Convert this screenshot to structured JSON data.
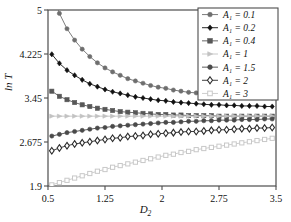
{
  "chart_data": {
    "type": "line",
    "title": "",
    "xlabel": "D2",
    "ylabel": "ln T",
    "xlim": [
      0.5,
      3.5
    ],
    "ylim": [
      1.9,
      5.0
    ],
    "xticks": [
      "0.5",
      "1.25",
      "2",
      "2.75",
      "3.5"
    ],
    "xtick_values": [
      0.5,
      1.25,
      2,
      2.75,
      3.5
    ],
    "yticks": [
      "1.9",
      "2.675",
      "3.45",
      "4.225",
      "5"
    ],
    "ytick_values": [
      1.9,
      2.675,
      3.45,
      4.225,
      5.0
    ],
    "grid": false,
    "legend_position": "top-right",
    "x": [
      0.55,
      0.65,
      0.75,
      0.85,
      0.95,
      1.05,
      1.15,
      1.25,
      1.35,
      1.45,
      1.55,
      1.65,
      1.75,
      1.85,
      1.95,
      2.05,
      2.15,
      2.25,
      2.35,
      2.45,
      2.55,
      2.65,
      2.75,
      2.85,
      2.95,
      3.05,
      3.15,
      3.25,
      3.35,
      3.45
    ],
    "series": [
      {
        "name": "A1 = 0.1",
        "label": "A₁ = 0.1",
        "marker": "filled-circle",
        "color": "#6e6e6e",
        "values": [
          5.38,
          4.94,
          4.67,
          4.47,
          4.31,
          4.18,
          4.07,
          3.98,
          3.91,
          3.85,
          3.79,
          3.75,
          3.71,
          3.67,
          3.64,
          3.62,
          3.59,
          3.57,
          3.55,
          3.54,
          3.52,
          3.51,
          3.5,
          3.49,
          3.48,
          3.47,
          3.47,
          3.46,
          3.46,
          3.45
        ]
      },
      {
        "name": "A1 = 0.2",
        "label": "A₁ = 0.2",
        "marker": "filled-diamond",
        "color": "#111111",
        "values": [
          4.22,
          4.06,
          3.94,
          3.85,
          3.77,
          3.7,
          3.65,
          3.6,
          3.56,
          3.53,
          3.5,
          3.47,
          3.45,
          3.43,
          3.41,
          3.4,
          3.38,
          3.37,
          3.36,
          3.35,
          3.34,
          3.33,
          3.33,
          3.32,
          3.32,
          3.31,
          3.31,
          3.31,
          3.3,
          3.3
        ]
      },
      {
        "name": "A1 = 0.4",
        "label": "A₁ = 0.4",
        "marker": "filled-square",
        "color": "#575757",
        "values": [
          3.57,
          3.48,
          3.42,
          3.37,
          3.33,
          3.3,
          3.27,
          3.25,
          3.23,
          3.21,
          3.2,
          3.19,
          3.18,
          3.17,
          3.16,
          3.16,
          3.15,
          3.15,
          3.14,
          3.14,
          3.14,
          3.14,
          3.13,
          3.13,
          3.13,
          3.13,
          3.13,
          3.13,
          3.13,
          3.13
        ]
      },
      {
        "name": "A1 = 1",
        "label": "A₁ = 1",
        "marker": "filled-triangle",
        "color": "#c2c2c2",
        "values": [
          3.13,
          3.13,
          3.13,
          3.13,
          3.13,
          3.13,
          3.13,
          3.13,
          3.13,
          3.13,
          3.13,
          3.13,
          3.13,
          3.13,
          3.13,
          3.13,
          3.13,
          3.13,
          3.13,
          3.13,
          3.13,
          3.13,
          3.13,
          3.13,
          3.13,
          3.13,
          3.13,
          3.13,
          3.13,
          3.13
        ]
      },
      {
        "name": "A1 = 1.5",
        "label": "A₁ = 1.5",
        "marker": "filled-circle",
        "color": "#4a4a4a",
        "values": [
          2.78,
          2.81,
          2.84,
          2.86,
          2.88,
          2.9,
          2.92,
          2.93,
          2.95,
          2.96,
          2.97,
          2.98,
          2.99,
          3.0,
          3.01,
          3.02,
          3.02,
          3.03,
          3.04,
          3.04,
          3.05,
          3.05,
          3.06,
          3.06,
          3.06,
          3.07,
          3.07,
          3.07,
          3.08,
          3.08
        ]
      },
      {
        "name": "A1 = 2",
        "label": "A₁ = 2",
        "marker": "open-diamond",
        "color": "#2b2b2b",
        "values": [
          2.52,
          2.57,
          2.61,
          2.64,
          2.66,
          2.68,
          2.7,
          2.72,
          2.74,
          2.75,
          2.77,
          2.78,
          2.79,
          2.81,
          2.82,
          2.83,
          2.84,
          2.85,
          2.86,
          2.86,
          2.87,
          2.88,
          2.89,
          2.89,
          2.9,
          2.91,
          2.91,
          2.92,
          2.92,
          2.93
        ]
      },
      {
        "name": "A1 = 3",
        "label": "A₁ = 3",
        "marker": "open-square",
        "color": "#c8c8c8",
        "values": [
          1.92,
          1.96,
          2.0,
          2.04,
          2.08,
          2.12,
          2.16,
          2.19,
          2.23,
          2.26,
          2.29,
          2.32,
          2.35,
          2.38,
          2.41,
          2.44,
          2.46,
          2.49,
          2.51,
          2.54,
          2.56,
          2.58,
          2.6,
          2.62,
          2.64,
          2.66,
          2.68,
          2.7,
          2.72,
          2.74
        ]
      }
    ]
  },
  "axes": {
    "x_title": "D",
    "x_title_sub": "2",
    "y_title": "ln T"
  },
  "style": {
    "frame_color": "#4d4d4d",
    "background": "#ffffff",
    "legend_border": "#4d4d4d"
  }
}
